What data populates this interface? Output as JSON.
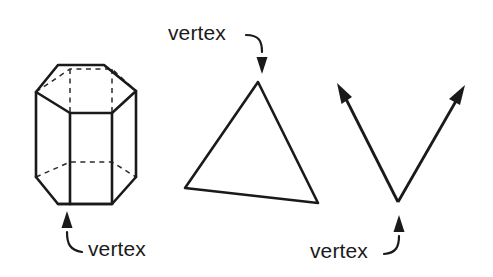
{
  "figure": {
    "background_color": "#ffffff",
    "line_color": "#1a1a1a",
    "hidden_edge_color": "#2b2b2b",
    "labels": [
      {
        "id": "prism-vertex-label",
        "text": "vertex",
        "x": 88,
        "y": 256,
        "points_to": "hexagonal-prism-bottom-front-vertex"
      },
      {
        "id": "triangle-vertex-label",
        "text": "vertex",
        "x": 168,
        "y": 40,
        "points_to": "triangle-apex-vertex"
      },
      {
        "id": "angle-vertex-label",
        "text": "vertex",
        "x": 310,
        "y": 258,
        "points_to": "angle-rays-vertex"
      }
    ],
    "shapes": [
      {
        "id": "hexagonal-prism",
        "name": "hexagonal prism",
        "type": "3d-solid",
        "faces": 8,
        "vertices": 12
      },
      {
        "id": "triangle",
        "name": "triangle",
        "type": "polygon",
        "vertices": 3,
        "points": "258,82 185,188 318,203"
      },
      {
        "id": "angle-rays",
        "name": "angle formed by two rays",
        "type": "angle",
        "vertex_point": "398,202",
        "ray_left_tip": "338,88",
        "ray_right_tip": "464,90"
      }
    ]
  }
}
